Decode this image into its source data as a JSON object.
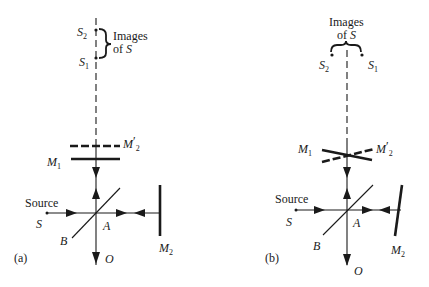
{
  "figure": {
    "panels": [
      {
        "id": "a",
        "panel_label": "(a)",
        "images_label_line1": "Images",
        "images_label_line2_prefix": "of ",
        "images_label_line2_var": "S",
        "s2_label": "S",
        "s2_sub": "2",
        "s1_label": "S",
        "s1_sub": "1",
        "m2prime_label": "M",
        "m2prime_prime": "′",
        "m2prime_sub": "2",
        "m1_label": "M",
        "m1_sub": "1",
        "source_label": "Source",
        "s_label": "S",
        "a_label": "A",
        "b_label": "B",
        "m2_label": "M",
        "m2_sub": "2",
        "o_label": "O",
        "mirror_configuration": "parallel"
      },
      {
        "id": "b",
        "panel_label": "(b)",
        "images_label_line1": "Images",
        "images_label_line2_prefix": "of ",
        "images_label_line2_var": "S",
        "s2_label": "S",
        "s2_sub": "2",
        "s1_label": "S",
        "s1_sub": "1",
        "m2prime_label": "M",
        "m2prime_prime": "′",
        "m2prime_sub": "2",
        "m1_label": "M",
        "m1_sub": "1",
        "source_label": "Source",
        "s_label": "S",
        "a_label": "A",
        "b_label": "B",
        "m2_label": "M",
        "m2_sub": "2",
        "o_label": "O",
        "mirror_configuration": "tilted"
      }
    ],
    "colors": {
      "ink": "#1a1a1a",
      "background": "#ffffff"
    }
  }
}
